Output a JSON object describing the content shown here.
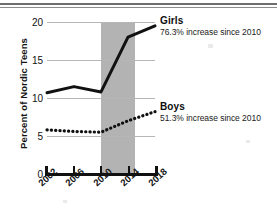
{
  "chart_data": {
    "type": "line",
    "title": "",
    "xlabel": "",
    "ylabel": "Percent of Nordic Teens",
    "x": [
      2002,
      2006,
      2010,
      2014,
      2018
    ],
    "xtick_labels": [
      "2002",
      "2006",
      "2010",
      "2014",
      "2018"
    ],
    "ytick_labels": [
      "0",
      "5",
      "10",
      "15",
      "20"
    ],
    "yticks": [
      0,
      5,
      10,
      15,
      20
    ],
    "ylim": [
      0,
      20
    ],
    "xlim": [
      2002,
      2018
    ],
    "grid": "horizontal",
    "legend_position": "right-inline",
    "series": [
      {
        "name": "Girls",
        "style": "solid",
        "color": "#111111",
        "values": [
          10.7,
          11.5,
          10.8,
          18.0,
          19.5
        ],
        "annotation_title": "Girls",
        "annotation_sub": "76.3% increase since 2010"
      },
      {
        "name": "Boys",
        "style": "dotted",
        "color": "#111111",
        "values": [
          5.8,
          5.6,
          5.5,
          7.0,
          8.2
        ],
        "annotation_title": "Boys",
        "annotation_sub": "51.3% increase since 2010"
      }
    ],
    "shaded_band": {
      "label": "",
      "x_start": 2010,
      "x_end": 2015,
      "color": "#b3b3b3"
    },
    "colors": {
      "gridline": "#b6b6b6",
      "axis": "#111111",
      "band": "#b3b3b3",
      "background": "#ffffff"
    }
  },
  "axis": {
    "y_title": "Percent of Nordic Teens"
  }
}
